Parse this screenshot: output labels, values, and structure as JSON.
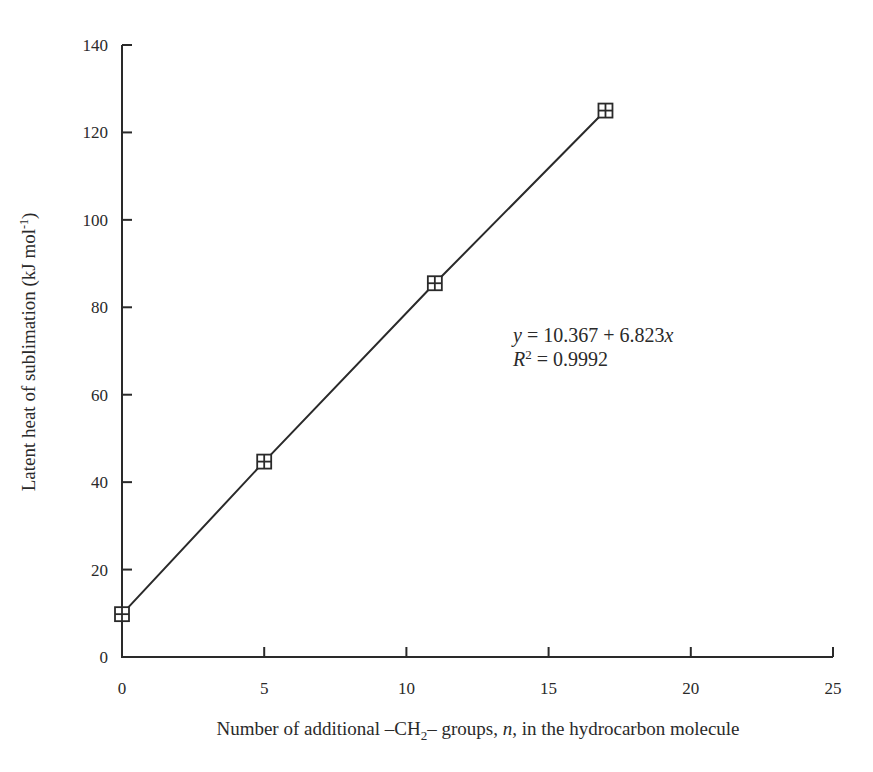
{
  "chart_data": {
    "type": "line",
    "title": "",
    "xlabel": "Number of additional –CH₂– groups, n, in the hydrocarbon molecule",
    "ylabel": "Latent heat of sublimation (kJ mol⁻¹)",
    "xlim": [
      0,
      25
    ],
    "ylim": [
      0,
      140
    ],
    "xticks": [
      0,
      5,
      10,
      15,
      20,
      25
    ],
    "yticks": [
      0,
      20,
      40,
      60,
      80,
      100,
      120,
      140
    ],
    "grid": false,
    "legend": null,
    "marker": "squared-plus",
    "series": [
      {
        "name": "Latent heat of sublimation",
        "x": [
          0,
          5,
          11,
          17
        ],
        "y": [
          9.8,
          44.7,
          85.5,
          125.0
        ]
      }
    ],
    "annotations": [
      {
        "text": "y = 10.367 + 6.823x",
        "x": 14,
        "y": 72
      },
      {
        "text": "R² = 0.9992",
        "x": 14,
        "y": 66
      }
    ]
  },
  "labels": {
    "xlabel_pre": "Number of additional –CH",
    "xlabel_sub": "2",
    "xlabel_post": "– groups, ",
    "xlabel_italic": "n",
    "xlabel_end": ", in the hydrocarbon molecule",
    "ylabel_main": "Latent heat of sublimation (kJ mol",
    "ylabel_sup": "-1",
    "ylabel_end": ")",
    "eq_y": "y",
    "eq_rest": " = 10.367 + 6.823",
    "eq_x": "x",
    "r2_R": "R",
    "r2_sup": "2",
    "r2_rest": " = 0.9992"
  }
}
